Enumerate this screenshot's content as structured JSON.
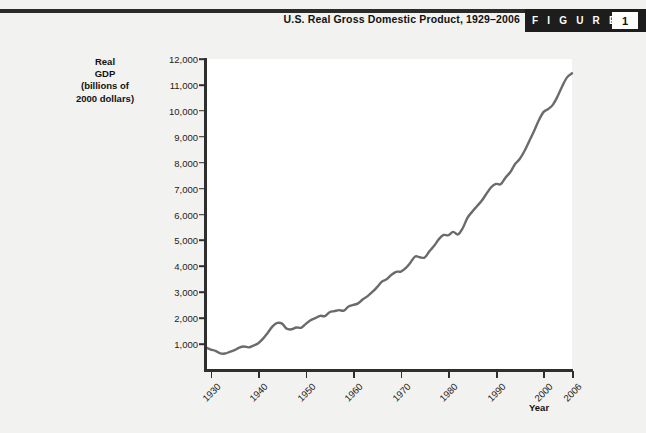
{
  "header": {
    "title": "U.S. Real Gross Domestic Product, 1929–2006",
    "badge_word": "F I G U R E",
    "badge_number": "1"
  },
  "axes": {
    "ylabel": "Real\nGDP\n(billions of\n2000 dollars)",
    "ylabel_lines": [
      "Real",
      "GDP",
      "(billions of",
      "2000 dollars)"
    ],
    "xlabel": "Year"
  },
  "chart_data": {
    "type": "line",
    "title": "U.S. Real Gross Domestic Product, 1929–2006",
    "xlabel": "Year",
    "ylabel": "Real GDP (billions of 2000 dollars)",
    "xlim": [
      1929,
      2006
    ],
    "ylim": [
      0,
      12000
    ],
    "ytick_labels": [
      "1,000",
      "2,000",
      "3,000",
      "4,000",
      "5,000",
      "6,000",
      "7,000",
      "8,000",
      "9,000",
      "10,000",
      "11,000",
      "12,000"
    ],
    "ytick_values": [
      1000,
      2000,
      3000,
      4000,
      5000,
      6000,
      7000,
      8000,
      9000,
      10000,
      11000,
      12000
    ],
    "xtick_labels": [
      "1930",
      "1940",
      "1950",
      "1960",
      "1970",
      "1980",
      "1990",
      "2000",
      "2006"
    ],
    "xtick_values": [
      1930,
      1940,
      1950,
      1960,
      1970,
      1980,
      1990,
      2000,
      2006
    ],
    "grid": false,
    "legend": null,
    "line_color": "#6b6b6b",
    "series": [
      {
        "name": "Real GDP",
        "x": [
          1929,
          1930,
          1931,
          1932,
          1933,
          1934,
          1935,
          1936,
          1937,
          1938,
          1939,
          1940,
          1941,
          1942,
          1943,
          1944,
          1945,
          1946,
          1947,
          1948,
          1949,
          1950,
          1951,
          1952,
          1953,
          1954,
          1955,
          1956,
          1957,
          1958,
          1959,
          1960,
          1961,
          1962,
          1963,
          1964,
          1965,
          1966,
          1967,
          1968,
          1969,
          1970,
          1971,
          1972,
          1973,
          1974,
          1975,
          1976,
          1977,
          1978,
          1979,
          1980,
          1981,
          1982,
          1983,
          1984,
          1985,
          1986,
          1987,
          1988,
          1989,
          1990,
          1991,
          1992,
          1993,
          1994,
          1995,
          1996,
          1997,
          1998,
          1999,
          2000,
          2001,
          2002,
          2003,
          2004,
          2005,
          2006
        ],
        "values": [
          865,
          790,
          740,
          645,
          635,
          700,
          765,
          865,
          905,
          875,
          945,
          1035,
          1210,
          1440,
          1680,
          1815,
          1790,
          1590,
          1570,
          1640,
          1630,
          1780,
          1920,
          2000,
          2090,
          2080,
          2230,
          2270,
          2310,
          2290,
          2450,
          2510,
          2570,
          2730,
          2850,
          3010,
          3200,
          3410,
          3500,
          3670,
          3790,
          3800,
          3930,
          4140,
          4380,
          4350,
          4340,
          4580,
          4790,
          5050,
          5210,
          5200,
          5330,
          5230,
          5470,
          5870,
          6110,
          6320,
          6530,
          6800,
          7050,
          7180,
          7170,
          7420,
          7630,
          7940,
          8140,
          8450,
          8830,
          9210,
          9630,
          9950,
          10070,
          10240,
          10570,
          10970,
          11300,
          11450
        ]
      }
    ],
    "annotations": [
      {
        "note": "Great Depression trough",
        "year": 1933,
        "value": 635
      },
      {
        "note": "World War II peak",
        "year": 1944,
        "value": 1815
      },
      {
        "note": "End of series",
        "year": 2006,
        "value": 11450
      }
    ]
  }
}
